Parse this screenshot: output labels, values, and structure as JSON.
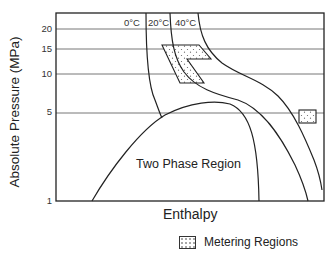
{
  "diagram": {
    "type": "pressure-enthalpy diagram",
    "y_axis": {
      "label": "Absolute Pressure (MPa)",
      "ticks": [
        "20",
        "15",
        "10",
        "5",
        "1"
      ]
    },
    "x_axis": {
      "label": "Enthalpy"
    },
    "isotherms": [
      {
        "label": "0°C"
      },
      {
        "label": "20°C"
      },
      {
        "label": "40°C"
      }
    ],
    "region_label": "Two Phase Region",
    "legend": {
      "label": "Metering Regions",
      "pattern": "stippled"
    },
    "colors": {
      "line": "#222222",
      "grid": "#555555",
      "background": "#ffffff"
    }
  }
}
